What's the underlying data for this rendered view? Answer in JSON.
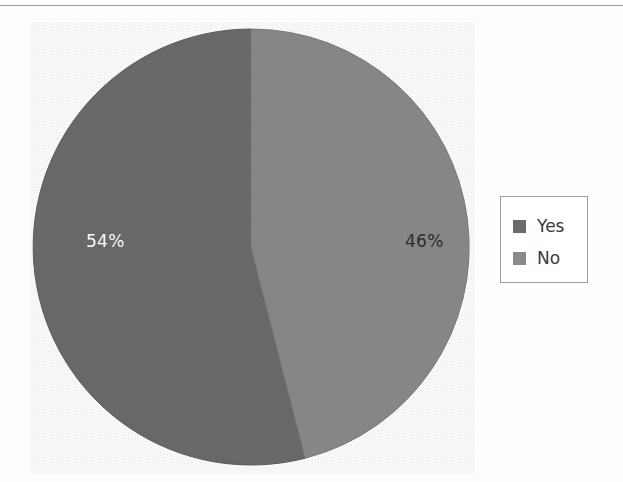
{
  "chart_data": {
    "type": "pie",
    "title": "",
    "categories": [
      "Yes",
      "No"
    ],
    "values": [
      54,
      46
    ],
    "labels": [
      "54%",
      "46%"
    ],
    "colors": [
      "#6b6b6b",
      "#8a8a8a"
    ],
    "legend_position": "right",
    "start_angle_deg": 0,
    "direction": "counterclockwise",
    "grid": false,
    "slices": [
      {
        "name": "Yes",
        "value": 54,
        "label": "54%",
        "color": "#6b6b6b",
        "label_color": "#ffffff"
      },
      {
        "name": "No",
        "value": 46,
        "label": "46%",
        "color": "#8a8a8a",
        "label_color": "#2e2e2e"
      }
    ]
  },
  "legend": {
    "items": [
      {
        "label": "Yes",
        "color": "#6b6b6b"
      },
      {
        "label": "No",
        "color": "#8a8a8a"
      }
    ]
  }
}
